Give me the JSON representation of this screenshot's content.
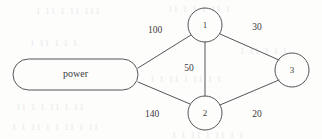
{
  "diagram": {
    "type": "weighted-graph",
    "nodes": [
      {
        "id": "power",
        "label": "power",
        "shape": "stadium",
        "cx": 75.5,
        "cy": 74.5,
        "w": 125,
        "h": 31
      },
      {
        "id": "n1",
        "label": "1",
        "shape": "circle",
        "cx": 205,
        "cy": 25,
        "r": 17
      },
      {
        "id": "n2",
        "label": "2",
        "shape": "circle",
        "cx": 205,
        "cy": 113,
        "r": 17
      },
      {
        "id": "n3",
        "label": "3",
        "shape": "circle",
        "cx": 292,
        "cy": 70,
        "r": 17
      }
    ],
    "edges": [
      {
        "from": "power",
        "to": "n1",
        "weight": "100",
        "x1": 138,
        "y1": 68,
        "x2": 191,
        "y2": 35,
        "lx": 155,
        "ly": 31
      },
      {
        "from": "power",
        "to": "n2",
        "weight": "140",
        "x1": 138,
        "y1": 82,
        "x2": 190,
        "y2": 104,
        "lx": 152,
        "ly": 115
      },
      {
        "from": "n1",
        "to": "n2",
        "weight": "50",
        "x1": 205,
        "y1": 42,
        "x2": 205,
        "y2": 96,
        "lx": 189,
        "ly": 69
      },
      {
        "from": "n1",
        "to": "n3",
        "weight": "30",
        "x1": 220,
        "y1": 34,
        "x2": 279,
        "y2": 60,
        "lx": 257,
        "ly": 28
      },
      {
        "from": "n2",
        "to": "n3",
        "weight": "20",
        "x1": 220,
        "y1": 105,
        "x2": 279,
        "y2": 80,
        "lx": 257,
        "ly": 115
      }
    ]
  },
  "artifacts": [
    {
      "text": "1 11 1  11 111",
      "x": 36,
      "y": 6
    },
    {
      "text": "11 1  1  1 11 1",
      "x": 168,
      "y": 4
    },
    {
      "text": "1 11   1 1 1",
      "x": 30,
      "y": 38
    },
    {
      "text": "1  11 1  1 1",
      "x": 240,
      "y": 46
    },
    {
      "text": "1 1 11 1   11 1 1",
      "x": 150,
      "y": 74
    },
    {
      "text": "11 1 1 11  1 11",
      "x": 16,
      "y": 102
    },
    {
      "text": "1 1 11  1 1  11 1 11",
      "x": 12,
      "y": 122
    },
    {
      "text": "1 1  11 1 11  1 1",
      "x": 172,
      "y": 130
    }
  ]
}
